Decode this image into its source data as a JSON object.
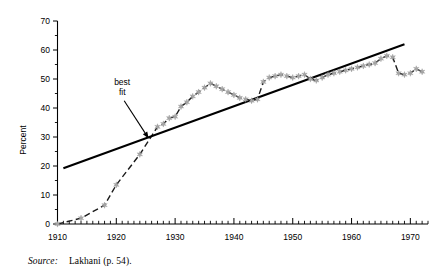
{
  "figure": {
    "source_label": "Source:",
    "source_text": "Lakhani (p. 54).",
    "annotation": {
      "line1": "best",
      "line2": "fit"
    }
  },
  "chart_data": {
    "type": "line",
    "title": "",
    "subtitle": "",
    "xlabel": "",
    "ylabel": "Percent",
    "xlim": [
      1910,
      1973
    ],
    "ylim": [
      0,
      70
    ],
    "grid": false,
    "legend": "none",
    "x_major_ticks": [
      1910,
      1920,
      1930,
      1940,
      1950,
      1960,
      1970
    ],
    "x_tick_labels": [
      "1910",
      "1920",
      "1930",
      "1940",
      "1950",
      "1960",
      "1970"
    ],
    "x_minor_tick_step": 1,
    "y_major_ticks": [
      0,
      10,
      20,
      30,
      40,
      50,
      60,
      70
    ],
    "y_tick_labels": [
      "0",
      "10",
      "20",
      "30",
      "40",
      "50",
      "60",
      "70"
    ],
    "y_minor_ticks": [
      5,
      15,
      25,
      35,
      45,
      55,
      65
    ],
    "series": [
      {
        "name": "percent",
        "style": "dashed-line-with-star-markers",
        "marker": "star",
        "marker_color": "#a6a6a6",
        "line_color": "#1a1a1a",
        "x": [
          1910,
          1914,
          1918,
          1920,
          1924,
          1927,
          1928,
          1929,
          1930,
          1931,
          1932,
          1933,
          1934,
          1935,
          1936,
          1937,
          1938,
          1939,
          1940,
          1941,
          1942,
          1943,
          1944,
          1945,
          1946,
          1947,
          1948,
          1949,
          1950,
          1951,
          1952,
          1953,
          1954,
          1955,
          1956,
          1957,
          1958,
          1959,
          1960,
          1961,
          1962,
          1963,
          1964,
          1965,
          1966,
          1967,
          1968,
          1969,
          1970,
          1971,
          1972
        ],
        "y": [
          0,
          2,
          6.5,
          13.5,
          24,
          33.5,
          34.5,
          36.5,
          37,
          40.5,
          42,
          44,
          45.5,
          47,
          48.5,
          47.5,
          46.5,
          45.5,
          44.5,
          43.5,
          43,
          42.5,
          43,
          49,
          50.5,
          51,
          51.5,
          51,
          50.5,
          51,
          51.5,
          50,
          49.5,
          50.5,
          51.5,
          52,
          52.5,
          53,
          53.5,
          54,
          54.5,
          55,
          55.5,
          57,
          58,
          57.5,
          52,
          51.5,
          52,
          53.5,
          52.5
        ]
      },
      {
        "name": "best fit",
        "style": "solid-straight-line",
        "line_color": "#000000",
        "x": [
          1911,
          1969
        ],
        "y": [
          19.2,
          62.0
        ]
      }
    ],
    "annotations": [
      {
        "text": "best fit",
        "at_x": 1921,
        "at_y": 48,
        "arrow_to_x": 1925.5,
        "arrow_to_y": 29.5
      }
    ]
  }
}
